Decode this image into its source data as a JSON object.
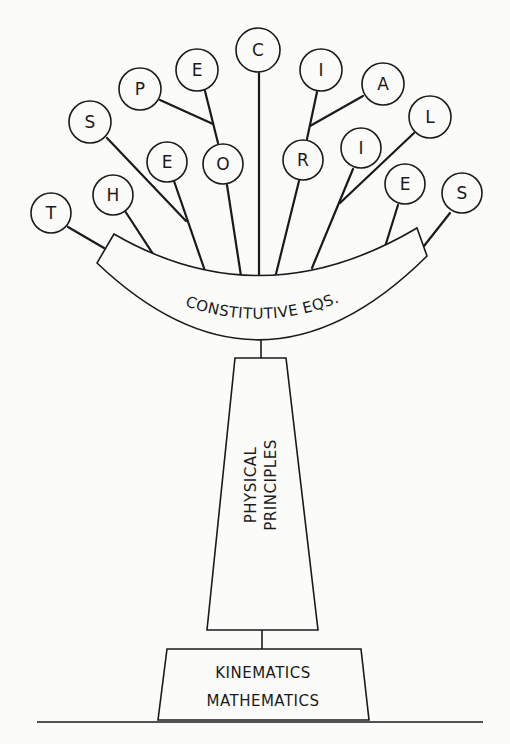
{
  "diagram": {
    "type": "tree-of-theories",
    "leaves": [
      {
        "letter": "T",
        "word": "THEORIES",
        "cx": 51,
        "cy": 213
      },
      {
        "letter": "H",
        "word": "THEORIES",
        "cx": 113,
        "cy": 195
      },
      {
        "letter": "E",
        "word": "THEORIES",
        "cx": 167,
        "cy": 162
      },
      {
        "letter": "S",
        "word": "SPECIAL",
        "cx": 90,
        "cy": 122
      },
      {
        "letter": "P",
        "word": "SPECIAL",
        "cx": 140,
        "cy": 89
      },
      {
        "letter": "E",
        "word": "SPECIAL",
        "cx": 197,
        "cy": 70
      },
      {
        "letter": "O",
        "word": "THEORIES",
        "cx": 223,
        "cy": 164
      },
      {
        "letter": "C",
        "word": "SPECIAL",
        "cx": 258,
        "cy": 50
      },
      {
        "letter": "R",
        "word": "THEORIES",
        "cx": 303,
        "cy": 160
      },
      {
        "letter": "I",
        "word": "SPECIAL",
        "cx": 321,
        "cy": 70
      },
      {
        "letter": "A",
        "word": "SPECIAL",
        "cx": 383,
        "cy": 84
      },
      {
        "letter": "I",
        "word": "THEORIES",
        "cx": 361,
        "cy": 148
      },
      {
        "letter": "L",
        "word": "SPECIAL",
        "cx": 430,
        "cy": 117
      },
      {
        "letter": "E",
        "word": "THEORIES",
        "cx": 405,
        "cy": 184
      },
      {
        "letter": "S",
        "word": "THEORIES",
        "cx": 462,
        "cy": 193
      }
    ],
    "readings": [
      "THEORIES",
      "SPECIAL"
    ],
    "banner": {
      "label": "CONSTITUTIVE EQS."
    },
    "trunk": {
      "line1": "PHYSICAL",
      "line2": "PRINCIPLES"
    },
    "base": {
      "line1": "KINEMATICS",
      "line2": "MATHEMATICS"
    },
    "colors": {
      "ink": "#1a1a1a",
      "paper": "#fbfbfa"
    }
  }
}
